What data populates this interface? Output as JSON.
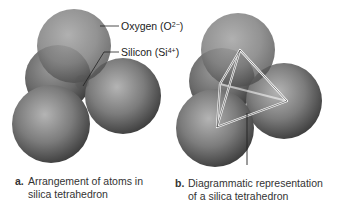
{
  "figure": {
    "labels": {
      "oxygen": {
        "name": "Oxygen",
        "charge_prefix": "(O",
        "charge_sup": "2−",
        "charge_suffix": ")"
      },
      "silicon": {
        "name": "Silicon",
        "charge_prefix": "(Si",
        "charge_sup": "4+",
        "charge_suffix": ")"
      }
    },
    "panels": [
      {
        "letter": "a.",
        "caption_line1": "Arrangement of atoms in",
        "caption_line2": "silica tetrahedron"
      },
      {
        "letter": "b.",
        "caption_line1": "Diagrammatic representation",
        "caption_line2": "of a silica tetrahedron"
      }
    ],
    "colors": {
      "sphere_light": "#b8b8b8",
      "sphere_mid": "#7a7a7a",
      "sphere_dark": "#3a3a3a",
      "leader_line": "#222222",
      "tetra_line": "#ffffff"
    }
  }
}
